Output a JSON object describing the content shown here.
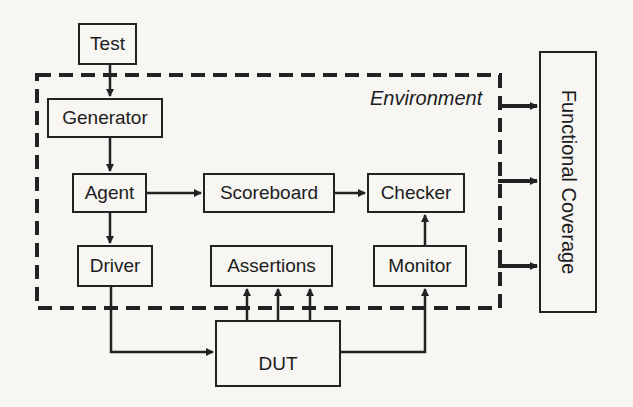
{
  "diagram": {
    "environment_label": "Environment",
    "nodes": {
      "test": "Test",
      "generator": "Generator",
      "agent": "Agent",
      "scoreboard": "Scoreboard",
      "checker": "Checker",
      "driver": "Driver",
      "assertions": "Assertions",
      "monitor": "Monitor",
      "dut": "DUT",
      "functional_coverage": "Functional Coverage"
    },
    "edges": [
      {
        "from": "Test",
        "to": "Generator"
      },
      {
        "from": "Generator",
        "to": "Agent"
      },
      {
        "from": "Agent",
        "to": "Scoreboard"
      },
      {
        "from": "Agent",
        "to": "Driver"
      },
      {
        "from": "Scoreboard",
        "to": "Checker"
      },
      {
        "from": "Monitor",
        "to": "Checker"
      },
      {
        "from": "Driver",
        "to": "DUT"
      },
      {
        "from": "DUT",
        "to": "Assertions",
        "count": 3
      },
      {
        "from": "DUT",
        "to": "Monitor"
      },
      {
        "from": "Environment",
        "to": "Functional Coverage",
        "count": 3
      }
    ],
    "colors": {
      "stroke": "#222222",
      "background": "#f7f6f3"
    }
  }
}
